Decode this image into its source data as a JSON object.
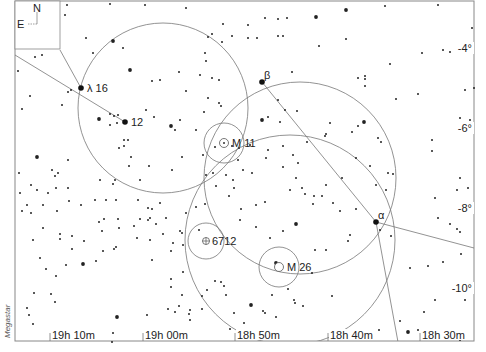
{
  "chart_data": {
    "type": "scatter",
    "title": "",
    "subtitle": "",
    "xlabel": "Right Ascension",
    "ylabel": "Declination",
    "credit": "Megastar",
    "compass": {
      "north": "N",
      "east": "E"
    },
    "x_ticks": [
      {
        "label": "19h 10m",
        "x": 50
      },
      {
        "label": "19h 00m",
        "x": 143
      },
      {
        "label": "18h 50m",
        "x": 235
      },
      {
        "label": "18h 40m",
        "x": 328
      },
      {
        "label": "18h 30m",
        "x": 420
      }
    ],
    "y_ticks": [
      {
        "label": "-4°",
        "y": 50
      },
      {
        "label": "-6°",
        "y": 130
      },
      {
        "label": "-8°",
        "y": 210
      },
      {
        "label": "-10°",
        "y": 290
      }
    ],
    "grid": false,
    "labeled_objects": [
      {
        "label": "λ 16",
        "kind": "star",
        "x": 81,
        "y": 88
      },
      {
        "label": "12",
        "kind": "star",
        "x": 125,
        "y": 122
      },
      {
        "label": "β",
        "kind": "star",
        "x": 262,
        "y": 82
      },
      {
        "label": "α",
        "kind": "star",
        "x": 376,
        "y": 222
      },
      {
        "label": "M 11",
        "kind": "open-cluster",
        "x": 224,
        "y": 143
      },
      {
        "label": "6712",
        "kind": "globular-cluster",
        "x": 206,
        "y": 241
      },
      {
        "label": "M 26",
        "kind": "open-cluster",
        "x": 279,
        "y": 267
      }
    ],
    "circles": [
      {
        "cx": 163,
        "cy": 108,
        "r": 85
      },
      {
        "cx": 300,
        "cy": 178,
        "r": 96
      },
      {
        "cx": 290,
        "cy": 240,
        "r": 105
      },
      {
        "cx": 224,
        "cy": 143,
        "r": 20
      },
      {
        "cx": 206,
        "cy": 241,
        "r": 18
      },
      {
        "cx": 279,
        "cy": 267,
        "r": 20
      }
    ],
    "lines": [
      {
        "x1": 15,
        "y1": 55,
        "x2": 125,
        "y2": 122
      },
      {
        "x1": 60,
        "y1": 50,
        "x2": 81,
        "y2": 88
      },
      {
        "x1": 262,
        "y1": 82,
        "x2": 376,
        "y2": 222
      },
      {
        "x1": 376,
        "y1": 222,
        "x2": 474,
        "y2": 248
      },
      {
        "x1": 376,
        "y1": 222,
        "x2": 398,
        "y2": 342
      }
    ],
    "stars": [
      [
        67,
        5,
        1
      ],
      [
        110,
        4,
        1
      ],
      [
        65,
        15,
        1
      ],
      [
        145,
        5,
        1
      ],
      [
        86,
        38,
        1
      ],
      [
        113,
        41,
        2
      ],
      [
        123,
        48,
        1
      ],
      [
        93,
        53,
        1
      ],
      [
        130,
        70,
        2
      ],
      [
        160,
        80,
        1
      ],
      [
        152,
        81,
        1
      ],
      [
        179,
        72,
        1
      ],
      [
        71,
        90,
        1
      ],
      [
        68,
        92,
        1
      ],
      [
        62,
        105,
        1
      ],
      [
        30,
        96,
        1
      ],
      [
        22,
        109,
        1
      ],
      [
        35,
        57,
        1
      ],
      [
        42,
        55,
        1
      ],
      [
        18,
        71,
        1
      ],
      [
        99,
        119,
        2
      ],
      [
        110,
        114,
        1
      ],
      [
        114,
        116,
        1
      ],
      [
        118,
        115,
        1
      ],
      [
        146,
        110,
        1
      ],
      [
        154,
        117,
        1
      ],
      [
        110,
        125,
        1
      ],
      [
        117,
        123,
        1
      ],
      [
        171,
        126,
        2
      ],
      [
        175,
        130,
        1
      ],
      [
        180,
        120,
        1
      ],
      [
        196,
        130,
        1
      ],
      [
        124,
        140,
        1
      ],
      [
        128,
        140,
        1
      ],
      [
        119,
        148,
        1
      ],
      [
        124,
        146,
        1
      ],
      [
        131,
        157,
        1
      ],
      [
        37,
        157,
        2
      ],
      [
        68,
        160,
        1
      ],
      [
        52,
        170,
        1
      ],
      [
        58,
        173,
        1
      ],
      [
        55,
        176,
        1
      ],
      [
        129,
        166,
        1
      ],
      [
        149,
        166,
        1
      ],
      [
        182,
        157,
        1
      ],
      [
        172,
        170,
        1
      ],
      [
        203,
        155,
        1
      ],
      [
        208,
        37,
        1
      ],
      [
        222,
        42,
        1
      ],
      [
        223,
        24,
        1
      ],
      [
        212,
        34,
        1
      ],
      [
        232,
        36,
        1
      ],
      [
        206,
        61,
        1
      ],
      [
        205,
        53,
        1
      ],
      [
        212,
        78,
        1
      ],
      [
        219,
        80,
        1
      ],
      [
        200,
        75,
        1
      ],
      [
        208,
        98,
        1
      ],
      [
        219,
        103,
        1
      ],
      [
        186,
        91,
        1
      ],
      [
        204,
        112,
        1
      ],
      [
        221,
        106,
        1
      ],
      [
        186,
        8,
        1
      ],
      [
        248,
        25,
        1
      ],
      [
        265,
        18,
        1
      ],
      [
        278,
        19,
        1
      ],
      [
        287,
        18,
        1
      ],
      [
        316,
        17,
        2
      ],
      [
        346,
        10,
        2
      ],
      [
        385,
        6,
        1
      ],
      [
        438,
        5,
        1
      ],
      [
        248,
        38,
        1
      ],
      [
        283,
        36,
        1
      ],
      [
        346,
        39,
        1
      ],
      [
        319,
        46,
        1
      ],
      [
        422,
        53,
        1
      ],
      [
        443,
        50,
        1
      ],
      [
        450,
        52,
        1
      ],
      [
        472,
        28,
        1
      ],
      [
        474,
        88,
        1
      ],
      [
        465,
        90,
        1
      ],
      [
        390,
        64,
        1
      ],
      [
        365,
        86,
        1
      ],
      [
        396,
        99,
        1
      ],
      [
        418,
        94,
        1
      ],
      [
        365,
        79,
        1
      ],
      [
        358,
        78,
        1
      ],
      [
        365,
        76,
        1
      ],
      [
        257,
        38,
        1
      ],
      [
        292,
        72,
        1
      ],
      [
        278,
        36,
        1
      ],
      [
        278,
        100,
        1
      ],
      [
        285,
        110,
        1
      ],
      [
        297,
        111,
        1
      ],
      [
        262,
        120,
        2
      ],
      [
        268,
        117,
        1
      ],
      [
        280,
        122,
        1
      ],
      [
        330,
        123,
        1
      ],
      [
        326,
        134,
        1
      ],
      [
        325,
        136,
        1
      ],
      [
        352,
        132,
        1
      ],
      [
        364,
        122,
        2
      ],
      [
        358,
        126,
        1
      ],
      [
        378,
        138,
        1
      ],
      [
        381,
        142,
        1
      ],
      [
        432,
        140,
        1
      ],
      [
        432,
        151,
        1
      ],
      [
        460,
        118,
        1
      ],
      [
        470,
        120,
        1
      ],
      [
        470,
        130,
        1
      ],
      [
        215,
        147,
        1
      ],
      [
        232,
        146,
        1
      ],
      [
        239,
        148,
        1
      ],
      [
        250,
        145,
        1
      ],
      [
        268,
        150,
        1
      ],
      [
        266,
        158,
        1
      ],
      [
        283,
        146,
        1
      ],
      [
        293,
        155,
        1
      ],
      [
        283,
        167,
        1
      ],
      [
        298,
        163,
        1
      ],
      [
        307,
        142,
        1
      ],
      [
        238,
        160,
        1
      ],
      [
        243,
        170,
        1
      ],
      [
        252,
        173,
        1
      ],
      [
        226,
        175,
        1
      ],
      [
        233,
        180,
        1
      ],
      [
        206,
        175,
        1
      ],
      [
        216,
        186,
        1
      ],
      [
        234,
        188,
        1
      ],
      [
        196,
        207,
        1
      ],
      [
        205,
        204,
        1
      ],
      [
        213,
        173,
        1
      ],
      [
        229,
        196,
        1
      ],
      [
        241,
        209,
        1
      ],
      [
        256,
        205,
        1
      ],
      [
        265,
        202,
        1
      ],
      [
        290,
        190,
        1
      ],
      [
        296,
        178,
        1
      ],
      [
        302,
        188,
        1
      ],
      [
        305,
        194,
        1
      ],
      [
        314,
        196,
        1
      ],
      [
        313,
        204,
        1
      ],
      [
        322,
        196,
        1
      ],
      [
        326,
        185,
        1
      ],
      [
        333,
        203,
        1
      ],
      [
        340,
        211,
        1
      ],
      [
        356,
        209,
        1
      ],
      [
        350,
        235,
        1
      ],
      [
        240,
        220,
        1
      ],
      [
        256,
        227,
        1
      ],
      [
        270,
        238,
        1
      ],
      [
        296,
        224,
        2
      ],
      [
        283,
        231,
        1
      ],
      [
        276,
        263,
        2
      ],
      [
        315,
        250,
        1
      ],
      [
        326,
        250,
        1
      ],
      [
        348,
        241,
        1
      ],
      [
        312,
        273,
        1
      ],
      [
        332,
        296,
        1
      ],
      [
        303,
        306,
        1
      ],
      [
        295,
        303,
        1
      ],
      [
        294,
        300,
        1
      ],
      [
        288,
        289,
        1
      ],
      [
        272,
        295,
        1
      ],
      [
        265,
        313,
        1
      ],
      [
        276,
        317,
        1
      ],
      [
        263,
        311,
        1
      ],
      [
        251,
        305,
        2
      ],
      [
        234,
        313,
        1
      ],
      [
        230,
        329,
        1
      ],
      [
        244,
        323,
        1
      ],
      [
        246,
        330,
        1
      ],
      [
        186,
        213,
        1
      ],
      [
        182,
        233,
        1
      ],
      [
        183,
        245,
        1
      ],
      [
        173,
        243,
        1
      ],
      [
        180,
        231,
        1
      ],
      [
        199,
        230,
        1
      ],
      [
        183,
        272,
        1
      ],
      [
        207,
        290,
        1
      ],
      [
        202,
        296,
        1
      ],
      [
        215,
        281,
        1
      ],
      [
        221,
        282,
        1
      ],
      [
        226,
        295,
        1
      ],
      [
        224,
        286,
        1
      ],
      [
        160,
        203,
        1
      ],
      [
        156,
        224,
        1
      ],
      [
        166,
        218,
        1
      ],
      [
        150,
        218,
        1
      ],
      [
        163,
        234,
        1
      ],
      [
        171,
        251,
        1
      ],
      [
        118,
        219,
        1
      ],
      [
        119,
        228,
        1
      ],
      [
        116,
        247,
        1
      ],
      [
        140,
        219,
        1
      ],
      [
        152,
        209,
        1
      ],
      [
        150,
        240,
        1
      ],
      [
        171,
        287,
        1
      ],
      [
        182,
        295,
        1
      ],
      [
        202,
        309,
        1
      ],
      [
        179,
        306,
        1
      ],
      [
        168,
        309,
        1
      ],
      [
        152,
        260,
        1
      ],
      [
        171,
        279,
        1
      ],
      [
        189,
        314,
        1
      ],
      [
        83,
        264,
        2
      ],
      [
        96,
        261,
        1
      ],
      [
        103,
        251,
        1
      ],
      [
        114,
        249,
        1
      ],
      [
        84,
        241,
        1
      ],
      [
        102,
        231,
        1
      ],
      [
        99,
        222,
        1
      ],
      [
        137,
        238,
        1
      ],
      [
        134,
        226,
        1
      ],
      [
        104,
        219,
        1
      ],
      [
        72,
        249,
        1
      ],
      [
        66,
        265,
        1
      ],
      [
        60,
        239,
        1
      ],
      [
        33,
        240,
        1
      ],
      [
        43,
        228,
        1
      ],
      [
        37,
        190,
        1
      ],
      [
        31,
        185,
        1
      ],
      [
        20,
        193,
        1
      ],
      [
        57,
        211,
        1
      ],
      [
        60,
        234,
        1
      ],
      [
        27,
        205,
        1
      ],
      [
        19,
        173,
        1
      ],
      [
        22,
        211,
        1
      ],
      [
        69,
        201,
        1
      ],
      [
        31,
        213,
        1
      ],
      [
        46,
        269,
        1
      ],
      [
        56,
        276,
        1
      ],
      [
        43,
        205,
        1
      ],
      [
        40,
        258,
        1
      ],
      [
        117,
        317,
        2
      ],
      [
        113,
        333,
        1
      ],
      [
        112,
        342,
        1
      ],
      [
        147,
        315,
        1
      ],
      [
        175,
        312,
        1
      ],
      [
        190,
        310,
        1
      ],
      [
        190,
        320,
        1
      ],
      [
        55,
        302,
        1
      ],
      [
        27,
        308,
        1
      ],
      [
        29,
        315,
        1
      ],
      [
        34,
        293,
        1
      ],
      [
        51,
        294,
        1
      ],
      [
        33,
        324,
        1
      ],
      [
        72,
        236,
        1
      ],
      [
        48,
        193,
        1
      ],
      [
        56,
        188,
        1
      ],
      [
        68,
        188,
        1
      ],
      [
        81,
        205,
        1
      ],
      [
        106,
        200,
        1
      ],
      [
        113,
        184,
        1
      ],
      [
        116,
        200,
        1
      ],
      [
        138,
        200,
        1
      ],
      [
        148,
        220,
        1
      ],
      [
        148,
        208,
        1
      ],
      [
        95,
        200,
        1
      ],
      [
        100,
        180,
        1
      ],
      [
        115,
        180,
        1
      ],
      [
        140,
        180,
        1
      ],
      [
        380,
        230,
        1
      ],
      [
        391,
        236,
        1
      ],
      [
        410,
        268,
        1
      ],
      [
        428,
        266,
        1
      ],
      [
        443,
        262,
        1
      ],
      [
        460,
        232,
        1
      ],
      [
        457,
        229,
        1
      ],
      [
        450,
        224,
        1
      ],
      [
        468,
        188,
        1
      ],
      [
        460,
        178,
        1
      ],
      [
        457,
        190,
        1
      ],
      [
        435,
        198,
        1
      ],
      [
        438,
        218,
        1
      ],
      [
        461,
        254,
        1
      ],
      [
        465,
        300,
        1
      ],
      [
        435,
        300,
        1
      ],
      [
        400,
        321,
        1
      ],
      [
        379,
        330,
        1
      ],
      [
        408,
        332,
        2
      ],
      [
        418,
        330,
        1
      ],
      [
        460,
        340,
        1
      ],
      [
        424,
        312,
        1
      ],
      [
        356,
        158,
        1
      ],
      [
        342,
        178,
        1
      ],
      [
        370,
        166,
        1
      ],
      [
        388,
        173,
        1
      ],
      [
        376,
        185,
        1
      ],
      [
        386,
        190,
        1
      ],
      [
        393,
        174,
        1
      ]
    ]
  }
}
